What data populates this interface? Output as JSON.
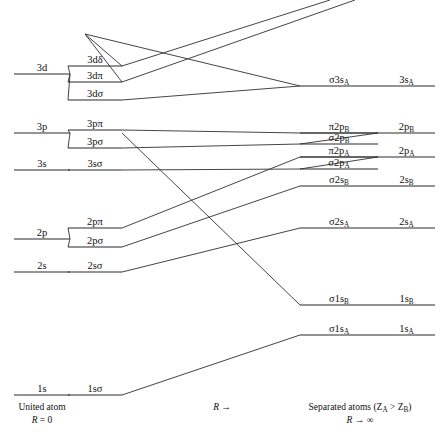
{
  "figure": {
    "type": "correlation-diagram",
    "title_left": "United atom",
    "title_left_sub": "(R = 0)",
    "title_middle": "R →",
    "title_right": "Separated atoms (Z",
    "title_right_subA": "A",
    "title_right_gt": " > Z",
    "title_right_subB": "B",
    "title_right_close": ")",
    "title_right_sub": "(R → ∞)",
    "line_color": "#2b2b2b",
    "background": "#ffffff"
  },
  "united_atom_levels": [
    {
      "name": "3d",
      "label": "3d",
      "y": 74,
      "x1": 14,
      "x2": 70
    },
    {
      "name": "3p",
      "label": "3p",
      "y": 133,
      "x1": 14,
      "x2": 70
    },
    {
      "name": "3s",
      "label": "3s",
      "y": 170,
      "x1": 14,
      "x2": 70
    },
    {
      "name": "2p",
      "label": "2p",
      "y": 239,
      "x1": 14,
      "x2": 70
    },
    {
      "name": "2s",
      "label": "2s",
      "y": 272,
      "x1": 14,
      "x2": 70
    },
    {
      "name": "1s",
      "label": "1s",
      "y": 395,
      "x1": 14,
      "x2": 70
    }
  ],
  "molecular_levels": [
    {
      "name": "3d-delta",
      "label": "3dδ",
      "y": 66,
      "x1": 68,
      "x2": 122
    },
    {
      "name": "3d-pi",
      "label": "3dπ",
      "y": 82,
      "x1": 68,
      "x2": 122
    },
    {
      "name": "3d-sigma",
      "label": "3dσ",
      "y": 100,
      "x1": 68,
      "x2": 122
    },
    {
      "name": "3p-pi",
      "label": "3pπ",
      "y": 130,
      "x1": 68,
      "x2": 122
    },
    {
      "name": "3p-sigma",
      "label": "3pσ",
      "y": 148,
      "x1": 68,
      "x2": 122
    },
    {
      "name": "3s-sigma",
      "label": "3sσ",
      "y": 170,
      "x1": 68,
      "x2": 122
    },
    {
      "name": "2p-pi",
      "label": "2pπ",
      "y": 228,
      "x1": 68,
      "x2": 122
    },
    {
      "name": "2p-sigma",
      "label": "2pσ",
      "y": 247,
      "x1": 68,
      "x2": 122
    },
    {
      "name": "2s-sigma",
      "label": "2sσ",
      "y": 272,
      "x1": 68,
      "x2": 122
    },
    {
      "name": "1s-sigma",
      "label": "1sσ",
      "y": 395,
      "x1": 68,
      "x2": 122
    }
  ],
  "mo_right_labels": [
    {
      "name": "sigma-3s-A",
      "pre": "σ3s",
      "sub": "A",
      "y": 86,
      "x1": 300,
      "x2": 378
    },
    {
      "name": "pi-2p-B",
      "pre": "π2p",
      "sub": "B",
      "y": 133,
      "x1": 300,
      "x2": 378
    },
    {
      "name": "sigma-2p-B",
      "pre": "σ2p",
      "sub": "B",
      "y": 144,
      "x1": 300,
      "x2": 378
    },
    {
      "name": "pi-2p-A",
      "pre": "π2p",
      "sub": "A",
      "y": 157,
      "x1": 300,
      "x2": 378
    },
    {
      "name": "sigma-2p-A",
      "pre": "σ2p",
      "sub": "A",
      "y": 169,
      "x1": 300,
      "x2": 378
    },
    {
      "name": "sigma-2s-B",
      "pre": "σ2s",
      "sub": "B",
      "y": 186,
      "x1": 300,
      "x2": 378
    },
    {
      "name": "sigma-2s-A",
      "pre": "σ2s",
      "sub": "A",
      "y": 228,
      "x1": 300,
      "x2": 378
    },
    {
      "name": "sigma-1s-B",
      "pre": "σ1s",
      "sub": "B",
      "y": 305,
      "x1": 300,
      "x2": 378
    },
    {
      "name": "sigma-1s-A",
      "pre": "σ1s",
      "sub": "A",
      "y": 335,
      "x1": 300,
      "x2": 378
    }
  ],
  "separated_atom_levels": [
    {
      "name": "3s-A",
      "pre": "3s",
      "sub": "A",
      "y": 86,
      "x1": 378,
      "x2": 435
    },
    {
      "name": "2p-B",
      "pre": "2p",
      "sub": "B",
      "y": 133,
      "x1": 378,
      "x2": 435
    },
    {
      "name": "2p-A",
      "pre": "2p",
      "sub": "A",
      "y": 157,
      "x1": 378,
      "x2": 435
    },
    {
      "name": "2s-B",
      "pre": "2s",
      "sub": "B",
      "y": 186,
      "x1": 378,
      "x2": 435
    },
    {
      "name": "2s-A",
      "pre": "2s",
      "sub": "A",
      "y": 228,
      "x1": 378,
      "x2": 435
    },
    {
      "name": "1s-B",
      "pre": "1s",
      "sub": "B",
      "y": 305,
      "x1": 378,
      "x2": 435
    },
    {
      "name": "1s-A",
      "pre": "1s",
      "sub": "A",
      "y": 335,
      "x1": 378,
      "x2": 435
    }
  ],
  "connectors": [
    {
      "name": "conn-3d-to-3ddelta",
      "points": "70,74 68,66"
    },
    {
      "name": "conn-3d-to-3dpi",
      "points": "70,74 68,82"
    },
    {
      "name": "conn-3d-to-3dsigma",
      "points": "70,74 68,100"
    },
    {
      "name": "conn-3p-to-3ppi",
      "points": "70,133 68,130"
    },
    {
      "name": "conn-3p-to-3psigma",
      "points": "70,133 68,148"
    },
    {
      "name": "conn-2p-to-2ppi",
      "points": "70,239 68,228"
    },
    {
      "name": "conn-2p-to-2psigma",
      "points": "70,239 68,247"
    },
    {
      "name": "conn-3ddelta-up",
      "points": "122,66 85,34"
    },
    {
      "name": "conn-3dpi-up",
      "points": "122,82 85,34"
    },
    {
      "name": "conn-3ddelta-right",
      "points": "122,66 330,0"
    },
    {
      "name": "conn-3dpi-right",
      "points": "122,82 355,0"
    },
    {
      "name": "conn-3dsigma-right",
      "points": "122,100 300,86"
    },
    {
      "name": "conn-3ppi-right",
      "points": "122,130 300,133"
    },
    {
      "name": "conn-3psigma-right",
      "points": "122,148 300,144"
    },
    {
      "name": "conn-3ssigma-right",
      "points": "122,170 300,169"
    },
    {
      "name": "conn-2ppi-right",
      "points": "122,228 300,157"
    },
    {
      "name": "conn-2psigma-right",
      "points": "122,247 300,186"
    },
    {
      "name": "conn-2ssigma-right",
      "points": "122,272 300,228"
    },
    {
      "name": "conn-1ssigma-right",
      "points": "122,395 300,335"
    },
    {
      "name": "conn-top-desc",
      "points": "85,34 300,86"
    },
    {
      "name": "conn-3slope-B",
      "points": "122,133 300,305"
    },
    {
      "name": "merge-pi2pB",
      "points": "378,133 340,133 300,133"
    },
    {
      "name": "merge-sigma2pB",
      "points": "300,144 378,133"
    },
    {
      "name": "merge-pi2pA",
      "points": "300,157 378,157"
    },
    {
      "name": "merge-sigma2pA",
      "points": "300,169 378,157"
    }
  ]
}
